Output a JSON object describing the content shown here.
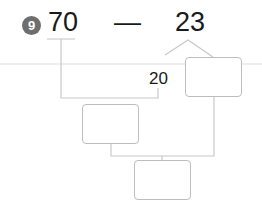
{
  "problem": {
    "number": "9",
    "minuend": "70",
    "operator": "—",
    "subtrahend": "23",
    "split_part": "20",
    "answer_boxes": [
      "",
      "",
      ""
    ]
  },
  "colors": {
    "badge": "#6e6e6e",
    "lines": "#c4c4c4",
    "divider": "#e6e6e6",
    "text": "#1a1a1a"
  }
}
